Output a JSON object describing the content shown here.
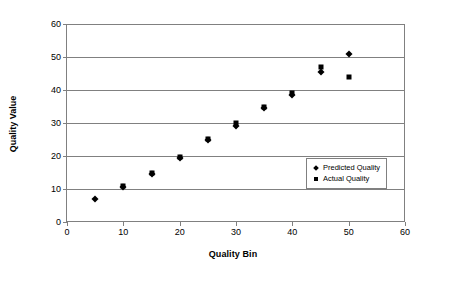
{
  "chart_data": {
    "type": "scatter",
    "title": "",
    "xlabel": "Quality Bin",
    "ylabel": "Quality Value",
    "xlim": [
      0,
      60
    ],
    "ylim": [
      0,
      60
    ],
    "xticks": [
      0,
      10,
      20,
      30,
      40,
      50,
      60
    ],
    "yticks": [
      0,
      10,
      20,
      30,
      40,
      50,
      60
    ],
    "grid": "horizontal",
    "legend_position": "inside-lower-right",
    "series": [
      {
        "name": "Predicted Quality",
        "marker": "diamond",
        "color": "#000000",
        "x": [
          5,
          10,
          15,
          20,
          25,
          30,
          35,
          40,
          45,
          50
        ],
        "y": [
          7,
          10.5,
          14.5,
          19.5,
          25,
          29,
          34.5,
          38.5,
          45.5,
          51
        ]
      },
      {
        "name": "Actual Quality",
        "marker": "square",
        "color": "#000000",
        "x": [
          10,
          15,
          20,
          25,
          30,
          35,
          40,
          45,
          50
        ],
        "y": [
          11,
          14.8,
          19.7,
          25.2,
          30,
          34.8,
          39.2,
          47,
          44
        ]
      }
    ]
  },
  "axes": {
    "x_title": "Quality Bin",
    "y_title": "Quality Value",
    "x_tick_labels": [
      "0",
      "10",
      "20",
      "30",
      "40",
      "50",
      "60"
    ],
    "y_tick_labels": [
      "0",
      "10",
      "20",
      "30",
      "40",
      "50",
      "60"
    ]
  },
  "legend": {
    "entries": [
      {
        "label": "Predicted Quality",
        "marker": "diamond-marker-icon"
      },
      {
        "label": "Actual Quality",
        "marker": "square-marker-icon"
      }
    ]
  },
  "caption": {
    "line": "cut-off caption text"
  }
}
